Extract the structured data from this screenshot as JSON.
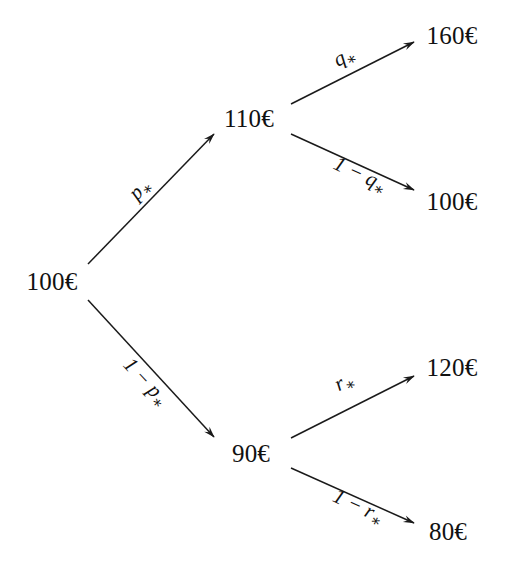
{
  "diagram": {
    "background_color": "#ffffff",
    "stroke_color": "#1a1a1a",
    "text_color": "#111111"
  },
  "nodes": [
    {
      "id": "root",
      "label": "100€",
      "x": 52,
      "y": 281
    },
    {
      "id": "up",
      "label": "110€",
      "x": 249,
      "y": 118
    },
    {
      "id": "down",
      "label": "90€",
      "x": 251,
      "y": 453
    },
    {
      "id": "uu",
      "label": "160€",
      "x": 452,
      "y": 35
    },
    {
      "id": "ud",
      "label": "100€",
      "x": 452,
      "y": 201
    },
    {
      "id": "du",
      "label": "120€",
      "x": 452,
      "y": 367
    },
    {
      "id": "dd",
      "label": "80€",
      "x": 448,
      "y": 531
    }
  ],
  "edges": [
    {
      "id": "root-up",
      "from": "root",
      "to": "up",
      "x1": 88,
      "y1": 264,
      "x2": 214,
      "y2": 134
    },
    {
      "id": "root-down",
      "from": "root",
      "to": "down",
      "x1": 88,
      "y1": 300,
      "x2": 214,
      "y2": 437
    },
    {
      "id": "up-uu",
      "from": "up",
      "to": "uu",
      "x1": 291,
      "y1": 104,
      "x2": 414,
      "y2": 42
    },
    {
      "id": "up-ud",
      "from": "up",
      "to": "ud",
      "x1": 291,
      "y1": 134,
      "x2": 414,
      "y2": 190
    },
    {
      "id": "down-du",
      "from": "down",
      "to": "du",
      "x1": 291,
      "y1": 438,
      "x2": 414,
      "y2": 376
    },
    {
      "id": "down-dd",
      "from": "down",
      "to": "dd",
      "x1": 291,
      "y1": 468,
      "x2": 414,
      "y2": 523
    }
  ],
  "edge_labels": [
    {
      "id": "label-p",
      "edge": "root-up",
      "prefix": "",
      "symbol": "p",
      "star": "∗",
      "x": 141,
      "y": 190,
      "rotation": -46
    },
    {
      "id": "label-one-minus-p",
      "edge": "root-down",
      "prefix": "1 − ",
      "symbol": "p",
      "star": "∗",
      "x": 145,
      "y": 383,
      "rotation": 47
    },
    {
      "id": "label-q",
      "edge": "up-uu",
      "prefix": "",
      "symbol": "q",
      "star": "∗",
      "x": 345,
      "y": 58,
      "rotation": -27
    },
    {
      "id": "label-one-minus-q",
      "edge": "up-ud",
      "prefix": "1 − ",
      "symbol": "q",
      "star": "∗",
      "x": 360,
      "y": 176,
      "rotation": 25
    },
    {
      "id": "label-r",
      "edge": "down-du",
      "prefix": "",
      "symbol": "r",
      "star": "∗",
      "x": 345,
      "y": 383,
      "rotation": -27
    },
    {
      "id": "label-one-minus-r",
      "edge": "down-dd",
      "prefix": "1 − ",
      "symbol": "r",
      "star": "∗",
      "x": 358,
      "y": 508,
      "rotation": 25
    }
  ]
}
